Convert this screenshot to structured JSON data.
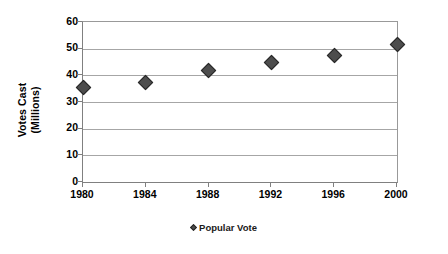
{
  "chart_data": {
    "type": "scatter",
    "title": "",
    "xlabel": "",
    "ylabel": "Votes Cast (Millions)",
    "ylabel_lines": [
      "Votes Cast",
      "(Millions)"
    ],
    "categories": [
      "1980",
      "1984",
      "1988",
      "1992",
      "1996",
      "2000"
    ],
    "x": [
      1980,
      1984,
      1988,
      1992,
      1996,
      2000
    ],
    "series": [
      {
        "name": "Popular Vote",
        "values": [
          35.5,
          37.5,
          42,
          45,
          47.5,
          51.5
        ],
        "marker": "diamond",
        "color": "#4d4d4d"
      }
    ],
    "ylim": [
      0,
      60
    ],
    "y_ticks": [
      0,
      10,
      20,
      30,
      40,
      50,
      60
    ],
    "y_tick_labels": [
      "0",
      "10",
      "20",
      "30",
      "40",
      "50",
      "60"
    ],
    "x_tick_labels": [
      "1980",
      "1984",
      "1988",
      "1992",
      "1996",
      "2000"
    ],
    "grid": "horizontal",
    "legend_position": "bottom",
    "legend_entries": [
      "Popular Vote"
    ],
    "colors": {
      "marker_fill": "#4d4d4d",
      "marker_edge": "#262626",
      "gridline": "#a6a6a6",
      "axis": "#808080",
      "plot_background": "#ffffff",
      "text": "#000000"
    }
  },
  "legend": {
    "marker_icon": "diamond-marker-icon",
    "label": "Popular Vote"
  }
}
